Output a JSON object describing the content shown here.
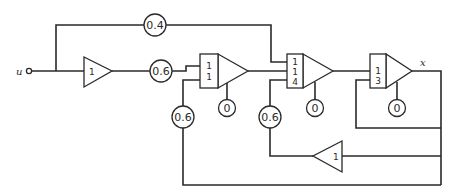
{
  "diagram": {
    "type": "analog-computer-block-diagram",
    "signals": {
      "input": "u",
      "output": "x"
    },
    "potentiometers": {
      "feedforward_top": "0.4",
      "forward_main": "0.6",
      "feedback_int1": "0.6",
      "feedback_int2": "0.6",
      "ic_int1": "0",
      "ic_int2": "0",
      "ic_int3": "0"
    },
    "amplifiers": {
      "input_inverter_gain": "1",
      "feedback_inverter_gain": "1"
    },
    "integrators": [
      {
        "name": "integrator-1",
        "gains": [
          "1",
          "1"
        ]
      },
      {
        "name": "integrator-2",
        "gains": [
          "1",
          "1",
          "4"
        ]
      },
      {
        "name": "integrator-3",
        "gains": [
          "1",
          "3"
        ]
      }
    ]
  }
}
